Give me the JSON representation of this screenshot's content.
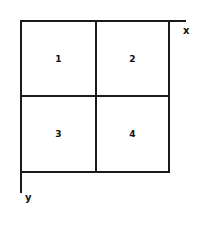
{
  "diagram": {
    "type": "quadrant-grid",
    "axes": {
      "x_label": "x",
      "y_label": "y"
    },
    "cells": [
      {
        "label": "1",
        "position": "top-left"
      },
      {
        "label": "2",
        "position": "top-right"
      },
      {
        "label": "3",
        "position": "bottom-left"
      },
      {
        "label": "4",
        "position": "bottom-right"
      }
    ],
    "colors": {
      "line": "#1a1a1a",
      "background": "#ffffff"
    }
  }
}
